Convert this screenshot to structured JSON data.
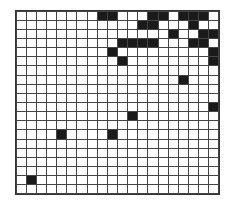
{
  "grid": {
    "rows": 20,
    "cols": 20,
    "fill_color": "#1a1a1a",
    "empty_color": "#ffffff",
    "line_color": "#444444",
    "filled_cells": [
      [
        0,
        8
      ],
      [
        0,
        9
      ],
      [
        0,
        13
      ],
      [
        0,
        14
      ],
      [
        0,
        16
      ],
      [
        0,
        17
      ],
      [
        0,
        18
      ],
      [
        1,
        12
      ],
      [
        1,
        13
      ],
      [
        1,
        17
      ],
      [
        2,
        15
      ],
      [
        2,
        18
      ],
      [
        2,
        19
      ],
      [
        3,
        10
      ],
      [
        3,
        11
      ],
      [
        3,
        12
      ],
      [
        3,
        13
      ],
      [
        3,
        17
      ],
      [
        3,
        18
      ],
      [
        4,
        9
      ],
      [
        4,
        19
      ],
      [
        5,
        10
      ],
      [
        5,
        19
      ],
      [
        7,
        16
      ],
      [
        10,
        19
      ],
      [
        11,
        11
      ],
      [
        13,
        4
      ],
      [
        13,
        9
      ],
      [
        18,
        1
      ]
    ]
  }
}
